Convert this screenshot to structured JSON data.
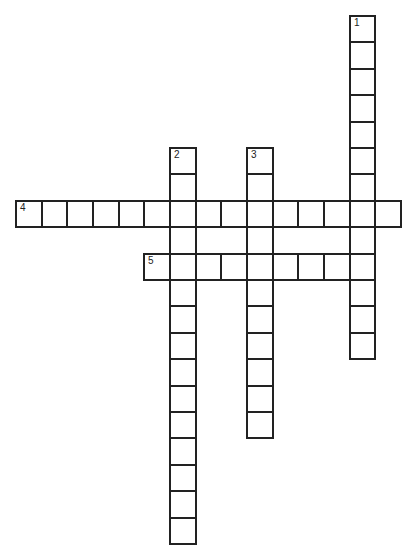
{
  "puzzle": {
    "grid": {
      "origin_x": 15,
      "origin_y": 15,
      "cell_w": 25.67,
      "cell_h": 26.4,
      "border_color": "#222222"
    },
    "words": [
      {
        "number": "1",
        "direction": "down",
        "row": 0,
        "col": 13,
        "length": 13
      },
      {
        "number": "2",
        "direction": "down",
        "row": 5,
        "col": 6,
        "length": 15
      },
      {
        "number": "3",
        "direction": "down",
        "row": 5,
        "col": 9,
        "length": 11
      },
      {
        "number": "4",
        "direction": "across",
        "row": 7,
        "col": 0,
        "length": 15
      },
      {
        "number": "5",
        "direction": "across",
        "row": 9,
        "col": 5,
        "length": 9
      }
    ]
  }
}
